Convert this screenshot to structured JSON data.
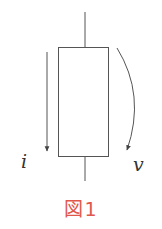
{
  "figure": {
    "caption": "図1",
    "caption_color": "#e2574c",
    "line_color": "#555555"
  },
  "element": {
    "shape": "rectangle",
    "terminals": [
      "top",
      "bottom"
    ]
  },
  "labels": {
    "current": "i",
    "voltage": "v"
  },
  "arrows": {
    "current": {
      "label": "i",
      "direction": "down",
      "style": "straight"
    },
    "voltage": {
      "label": "v",
      "direction": "down",
      "style": "curved"
    }
  }
}
